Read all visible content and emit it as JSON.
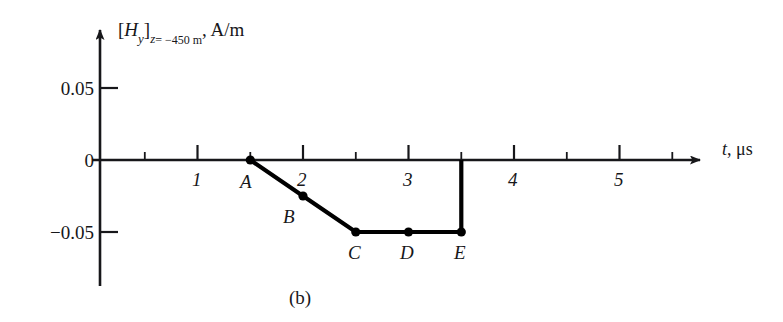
{
  "figure": {
    "caption": "(b)",
    "panel_id": "b"
  },
  "axes": {
    "x": {
      "label_variable": "t",
      "label_unit": "μs",
      "label_full": "t, μs",
      "ticks_major": [
        1,
        2,
        3,
        4,
        5
      ],
      "tick_labels": [
        "1",
        "2",
        "3",
        "4",
        "5"
      ],
      "ticks_minor": [
        0.5,
        1.5,
        2.5,
        3.5,
        4.5,
        5.5
      ],
      "range": [
        0,
        5.75
      ]
    },
    "y": {
      "label_quantity": "[H",
      "label_sub_component": "y",
      "label_bracket_close": "]",
      "label_sub_condition": "z",
      "label_condition_value": "= −450 m",
      "label_unit": ", A/m",
      "label_full": "[H_y]_(z = −450 m), A/m",
      "ticks": [
        0.05,
        0,
        -0.05
      ],
      "tick_labels": [
        "0.05",
        "0",
        "−0.05"
      ],
      "range": [
        -0.08,
        0.07
      ]
    }
  },
  "chart_data": {
    "type": "line",
    "title": "",
    "subtitle": "",
    "xlabel": "t, μs",
    "ylabel": "[H_y]_(z = −450 m), A/m",
    "xlim": [
      0,
      5.75
    ],
    "ylim": [
      -0.08,
      0.07
    ],
    "grid": false,
    "legend": "none",
    "x": [
      1.5,
      2.0,
      2.5,
      3.0,
      3.5,
      3.5
    ],
    "y": [
      0,
      -0.025,
      -0.05,
      -0.05,
      -0.05,
      0
    ],
    "series": [
      {
        "name": "H_y waveform",
        "x": [
          1.5,
          2.0,
          2.5,
          3.0,
          3.5,
          3.5
        ],
        "values": [
          0,
          -0.025,
          -0.05,
          -0.05,
          -0.05,
          0
        ],
        "color": "#000000"
      }
    ],
    "markers": [
      {
        "id": "A",
        "label": "A",
        "x": 1.5,
        "y": 0.0,
        "label_pos": "below-left"
      },
      {
        "id": "B",
        "label": "B",
        "x": 2.0,
        "y": -0.025,
        "label_pos": "below-left"
      },
      {
        "id": "C",
        "label": "C",
        "x": 2.5,
        "y": -0.05,
        "label_pos": "below"
      },
      {
        "id": "D",
        "label": "D",
        "x": 3.0,
        "y": -0.05,
        "label_pos": "below"
      },
      {
        "id": "E",
        "label": "E",
        "x": 3.5,
        "y": -0.05,
        "label_pos": "below"
      }
    ],
    "annotations": [
      {
        "text": "(b)",
        "role": "panel-caption"
      }
    ]
  }
}
